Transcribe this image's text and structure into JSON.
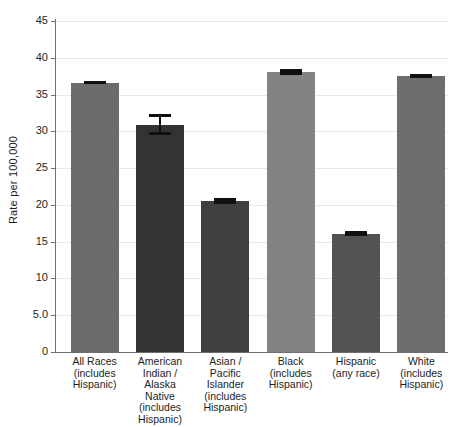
{
  "chart_data": {
    "type": "bar",
    "title": "",
    "subtitle": "",
    "xlabel": "",
    "ylabel": "Rate per 100,000",
    "ylim": [
      0,
      45
    ],
    "ytick_labels": [
      "45",
      "40",
      "35",
      "30",
      "25",
      "20",
      "15",
      "10",
      "5.0",
      "0"
    ],
    "ytick_values": [
      45,
      40,
      35,
      30,
      25,
      20,
      15,
      10,
      5,
      0
    ],
    "grid": true,
    "legend": "none",
    "categories": [
      "All Races (includes Hispanic)",
      "American Indian / Alaska Native (includes Hispanic)",
      "Asian / Pacific Islander (includes Hispanic)",
      "Black (includes Hispanic)",
      "Hispanic (any race)",
      "White (includes Hispanic)"
    ],
    "category_lines": [
      [
        "All Races",
        "(includes",
        "Hispanic)"
      ],
      [
        "American",
        "Indian /",
        "Alaska",
        "Native",
        "(includes",
        "Hispanic)"
      ],
      [
        "Asian /",
        "Pacific",
        "Islander",
        "(includes",
        "Hispanic)"
      ],
      [
        "Black",
        "(includes",
        "Hispanic)"
      ],
      [
        "Hispanic",
        "(any race)"
      ],
      [
        "White",
        "(includes",
        "Hispanic)"
      ]
    ],
    "values": [
      36.6,
      30.9,
      20.5,
      38.1,
      16.1,
      37.5
    ],
    "error_low": [
      36.4,
      29.5,
      20.1,
      37.7,
      15.8,
      37.2
    ],
    "error_high": [
      36.8,
      32.3,
      20.9,
      38.5,
      16.4,
      37.8
    ],
    "bar_colors": [
      "#6b6b6b",
      "#333333",
      "#3f3f3f",
      "#838383",
      "#535353",
      "#6e6e6e"
    ],
    "error_bar_color": "#101010"
  }
}
